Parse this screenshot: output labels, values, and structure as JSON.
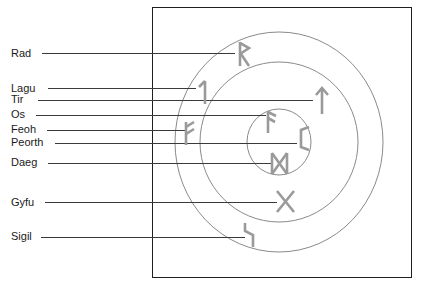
{
  "diagram": {
    "frame": {
      "x": 152,
      "y": 7,
      "width": 259,
      "height": 270
    },
    "colors": {
      "background": "#ffffff",
      "frame_stroke": "#1f1f1f",
      "ring_stroke": "#8a8a8a",
      "leader_stroke": "#3a3a3a",
      "rune_stroke": "#9a9a9a",
      "label_text": "#1a1a1a"
    },
    "rings": [
      {
        "name": "outer-ring",
        "cx": 279,
        "cy": 142,
        "rx": 104,
        "ry": 110
      },
      {
        "name": "middle-ring",
        "cx": 279,
        "cy": 142,
        "rx": 79,
        "ry": 80
      },
      {
        "name": "inner-ring",
        "cx": 279,
        "cy": 142,
        "rx": 32,
        "ry": 33
      }
    ],
    "labels": [
      {
        "id": "rad",
        "text": "Rad",
        "label_x": 11,
        "label_y": 57,
        "leader": {
          "x1": 42,
          "y1": 53,
          "x2": 235,
          "y2": 53
        },
        "rune": "rad-rune",
        "rune_x": 240,
        "rune_y": 42,
        "ring": "outer-ring"
      },
      {
        "id": "lagu",
        "text": "Lagu",
        "label_x": 11,
        "label_y": 92,
        "leader": {
          "x1": 48,
          "y1": 88,
          "x2": 196,
          "y2": 88
        },
        "rune": "lagu-rune",
        "rune_x": 199,
        "rune_y": 80,
        "ring": "outer-ring"
      },
      {
        "id": "tir",
        "text": "Tir",
        "label_x": 11,
        "label_y": 103,
        "leader": {
          "x1": 38,
          "y1": 100,
          "x2": 313,
          "y2": 100
        },
        "rune": "tir-rune",
        "rune_x": 316,
        "rune_y": 88,
        "ring": "middle-ring"
      },
      {
        "id": "os",
        "text": "Os",
        "label_x": 11,
        "label_y": 118,
        "leader": {
          "x1": 36,
          "y1": 115,
          "x2": 266,
          "y2": 115
        },
        "rune": "os-rune",
        "rune_x": 268,
        "rune_y": 111,
        "ring": "inner-ring"
      },
      {
        "id": "feoh",
        "text": "Feoh",
        "label_x": 11,
        "label_y": 133,
        "leader": {
          "x1": 47,
          "y1": 130,
          "x2": 185,
          "y2": 130
        },
        "rune": "feoh-rune",
        "rune_x": 186,
        "rune_y": 122,
        "ring": "outer-ring"
      },
      {
        "id": "peorth",
        "text": "Peorth",
        "label_x": 11,
        "label_y": 146,
        "leader": {
          "x1": 55,
          "y1": 143,
          "x2": 297,
          "y2": 143
        },
        "rune": "peorth-rune",
        "rune_x": 299,
        "rune_y": 127,
        "ring": "inner-ring"
      },
      {
        "id": "daeg",
        "text": "Daeg",
        "label_x": 11,
        "label_y": 166,
        "leader": {
          "x1": 48,
          "y1": 163,
          "x2": 272,
          "y2": 163
        },
        "rune": "daeg-rune",
        "rune_x": 272,
        "rune_y": 153,
        "ring": "inner-ring"
      },
      {
        "id": "gyfu",
        "text": "Gyfu",
        "label_x": 11,
        "label_y": 206,
        "leader": {
          "x1": 45,
          "y1": 202,
          "x2": 277,
          "y2": 202
        },
        "rune": "gyfu-rune",
        "rune_x": 277,
        "rune_y": 191,
        "ring": "middle-ring"
      },
      {
        "id": "sigil",
        "text": "Sigil",
        "label_x": 11,
        "label_y": 240,
        "leader": {
          "x1": 41,
          "y1": 237,
          "x2": 245,
          "y2": 237
        },
        "rune": "sigil-rune",
        "rune_x": 245,
        "rune_y": 223,
        "ring": "middle-ring"
      }
    ]
  }
}
